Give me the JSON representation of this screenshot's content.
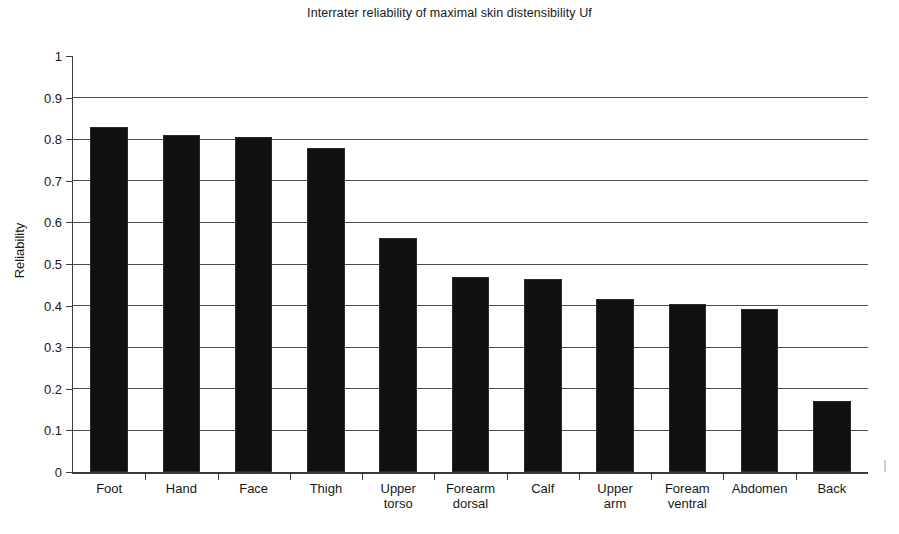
{
  "chart_data": {
    "type": "bar",
    "title": "Interrater reliability of maximal skin distensibility Uf",
    "xlabel": "",
    "ylabel": "Reliability",
    "ylim": [
      0,
      1
    ],
    "ytick_labels": [
      "1",
      "0.9",
      "0.8",
      "0.7",
      "0.6",
      "0.5",
      "0.4",
      "0.3",
      "0.2",
      "0.1",
      "0"
    ],
    "ytick_values": [
      1,
      0.9,
      0.8,
      0.7,
      0.6,
      0.5,
      0.4,
      0.3,
      0.2,
      0.1,
      0
    ],
    "grid": "horizontal",
    "legend": "none",
    "bar_color": "#101010",
    "categories": [
      "Foot",
      "Hand",
      "Face",
      "Thigh",
      "Upper torso",
      "Forearm dorsal",
      "Calf",
      "Upper arm",
      "Foream ventral",
      "Abdomen",
      "Back"
    ],
    "category_lines": [
      [
        "Foot"
      ],
      [
        "Hand"
      ],
      [
        "Face"
      ],
      [
        "Thigh"
      ],
      [
        "Upper",
        "torso"
      ],
      [
        "Forearm",
        "dorsal"
      ],
      [
        "Calf"
      ],
      [
        "Upper",
        "arm"
      ],
      [
        "Foream",
        "ventral"
      ],
      [
        "Abdomen"
      ],
      [
        "Back"
      ]
    ],
    "values": [
      0.83,
      0.81,
      0.805,
      0.78,
      0.562,
      0.469,
      0.464,
      0.415,
      0.403,
      0.391,
      0.17
    ]
  }
}
